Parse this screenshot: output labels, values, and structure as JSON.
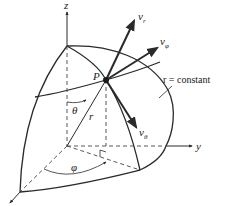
{
  "diagram": {
    "type": "spherical-coordinates-velocity-components",
    "colors": {
      "line": "#2a2a2a",
      "dashed": "#444444",
      "background": "#ffffff"
    },
    "axes": {
      "z": "z",
      "y": "y",
      "x": ""
    },
    "point": {
      "label": "P"
    },
    "vectors": [
      {
        "symbol": "v",
        "subscript": "r"
      },
      {
        "symbol": "v",
        "subscript": "φ"
      },
      {
        "symbol": "v",
        "subscript": "θ"
      }
    ],
    "annotations": {
      "surface": "r = constant",
      "theta": "θ",
      "radius": "r",
      "phi": "φ"
    }
  }
}
